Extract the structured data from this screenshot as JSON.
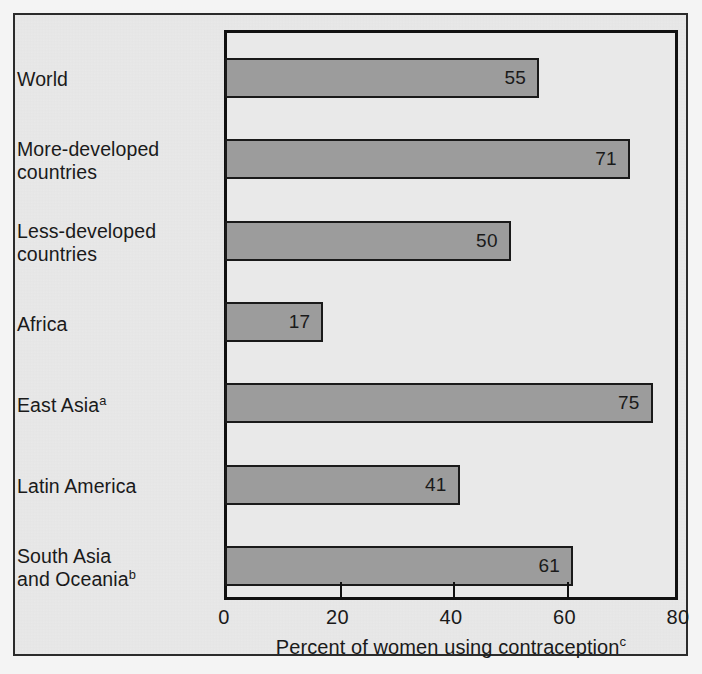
{
  "chart_data": {
    "type": "bar",
    "orientation": "horizontal",
    "title": "",
    "xlabel": "Percent of women using contraception",
    "xlabel_superscript": "c",
    "ylabel": "",
    "categories": [
      "World",
      "More-developed\ncountries",
      "Less-developed\ncountries",
      "Africa",
      "East Asia",
      "Latin America",
      "South Asia\nand Oceania"
    ],
    "category_superscripts": [
      "",
      "",
      "",
      "",
      "a",
      "",
      "b"
    ],
    "values": [
      55,
      71,
      50,
      17,
      75,
      41,
      61
    ],
    "value_labels": [
      "55",
      "71",
      "50",
      "17",
      "75",
      "41",
      "61"
    ],
    "xlim": [
      0,
      80
    ],
    "xticks": [
      0,
      20,
      40,
      60,
      80
    ],
    "xtick_labels": [
      "0",
      "20",
      "40",
      "60",
      "80"
    ],
    "grid": false,
    "legend": false,
    "colors": {
      "bar_fill": "#9c9c9c",
      "bar_border": "#1a1a1a",
      "plot_background": "#e9e9e9",
      "frame": "#111111",
      "text": "#1a1a1a"
    }
  }
}
